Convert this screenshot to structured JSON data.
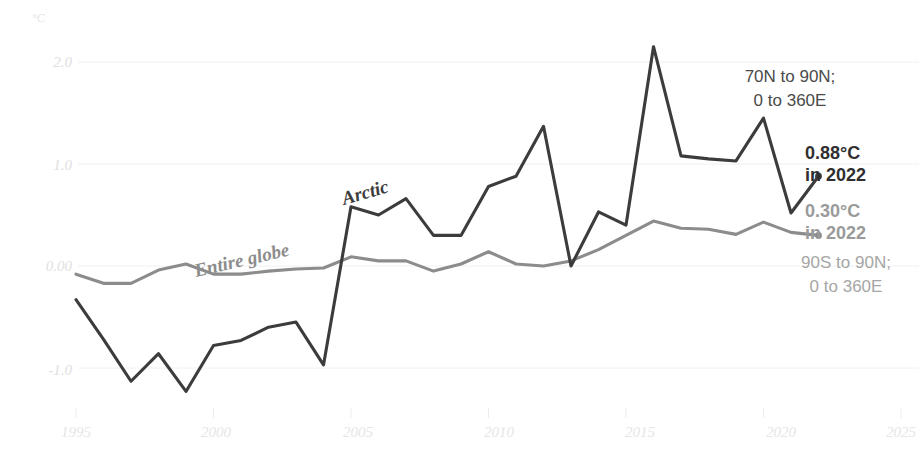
{
  "chart_data": {
    "type": "line",
    "title": "",
    "xlabel": "",
    "ylabel": "",
    "unit_label": "°C",
    "xlim": [
      1994.2,
      2025.6
    ],
    "ylim": [
      -1.45,
      2.35
    ],
    "grid": true,
    "legend_position": "inline-annotations",
    "xticks": [
      "1995",
      "2000",
      "2005",
      "2010",
      "2015",
      "2020",
      "2025"
    ],
    "xtick_values": [
      1995,
      2000,
      2005,
      2010,
      2015,
      2020,
      2025
    ],
    "yticks": [
      "2.0",
      "1.0",
      "0.00",
      "-1.0"
    ],
    "ytick_values": [
      2.0,
      1.0,
      0.0,
      -1.0
    ],
    "x": [
      1995,
      1996,
      1997,
      1998,
      1999,
      2000,
      2001,
      2002,
      2003,
      2004,
      2005,
      2006,
      2007,
      2008,
      2009,
      2010,
      2011,
      2012,
      2013,
      2014,
      2015,
      2016,
      2017,
      2018,
      2019,
      2020,
      2021,
      2022
    ],
    "series": [
      {
        "name": "Arctic",
        "color": "#3c3c3c",
        "region": "70N to 90N; 0 to 360E",
        "end_value_label": "0.88°C",
        "end_year_label": "in 2022",
        "values": [
          -0.33,
          -0.72,
          -1.13,
          -0.86,
          -1.23,
          -0.78,
          -0.73,
          -0.6,
          -0.55,
          -0.97,
          0.58,
          0.5,
          0.66,
          0.3,
          0.3,
          0.78,
          0.88,
          1.37,
          0.0,
          0.53,
          0.4,
          2.15,
          1.08,
          1.05,
          1.03,
          1.45,
          0.52,
          0.88
        ]
      },
      {
        "name": "Entire globe",
        "color": "#8c8c8c",
        "region": "90S to 90N; 0 to 360E",
        "end_value_label": "0.30°C",
        "end_year_label": "in 2022",
        "values": [
          -0.08,
          -0.17,
          -0.17,
          -0.04,
          0.02,
          -0.08,
          -0.08,
          -0.05,
          -0.03,
          -0.02,
          0.09,
          0.05,
          0.05,
          -0.05,
          0.02,
          0.14,
          0.02,
          0.0,
          0.05,
          0.16,
          0.3,
          0.44,
          0.37,
          0.36,
          0.31,
          0.43,
          0.33,
          0.3
        ]
      }
    ],
    "annotations": [
      {
        "name": "arctic-series-label",
        "text": "Arctic"
      },
      {
        "name": "globe-series-label",
        "text": "Entire globe"
      },
      {
        "name": "arctic-region-note-line1",
        "text": "70N to 90N;"
      },
      {
        "name": "arctic-region-note-line2",
        "text": "0 to 360E"
      },
      {
        "name": "globe-region-note-line1",
        "text": "90S to 90N;"
      },
      {
        "name": "globe-region-note-line2",
        "text": "0 to 360E"
      },
      {
        "name": "arctic-end-value",
        "text": "0.88°C"
      },
      {
        "name": "arctic-end-year",
        "text": "in 2022"
      },
      {
        "name": "globe-end-value",
        "text": "0.30°C"
      },
      {
        "name": "globe-end-year",
        "text": "in 2022"
      }
    ]
  },
  "labels": {
    "unit": "°C",
    "ytick_0": "2.0",
    "ytick_1": "1.0",
    "ytick_2": "0.00",
    "ytick_3": "-1.0",
    "xtick_0": "1995",
    "xtick_1": "2000",
    "xtick_2": "2005",
    "xtick_3": "2010",
    "xtick_4": "2015",
    "xtick_5": "2020",
    "xtick_6": "2025",
    "arctic_name": "Arctic",
    "globe_name": "Entire globe",
    "arctic_region_1": "70N to 90N;",
    "arctic_region_2": "0 to 360E",
    "globe_region_1": "90S to 90N;",
    "globe_region_2": "0 to 360E",
    "arctic_value": "0.88°C",
    "arctic_year": "in 2022",
    "globe_value": "0.30°C",
    "globe_year": "in 2022"
  },
  "colors": {
    "arctic": "#3c3c3c",
    "globe": "#8c8c8c",
    "grid": "#f0f0f0",
    "tick_text": "#e3e3e3",
    "background": "#ffffff"
  }
}
